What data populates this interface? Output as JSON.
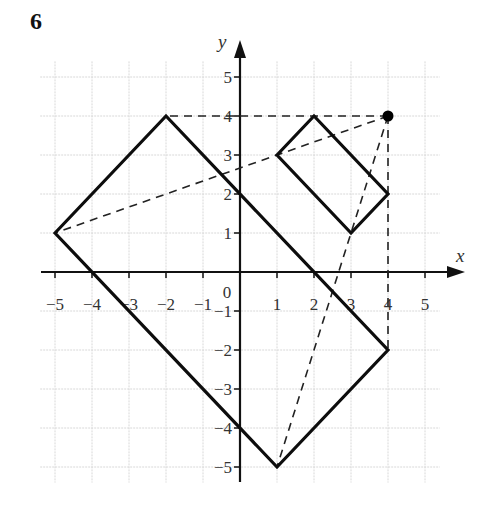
{
  "question_number": "6",
  "chart_data": {
    "type": "scatter",
    "title": "",
    "xlabel": "x",
    "ylabel": "y",
    "xlim": [
      -5.4,
      5.4
    ],
    "ylim": [
      -5.4,
      5.4
    ],
    "grid": true,
    "origin_label": "0",
    "x_ticks": [
      -5,
      -4,
      -3,
      -2,
      -1,
      1,
      2,
      3,
      4,
      5
    ],
    "y_ticks": [
      -5,
      -4,
      -3,
      -2,
      -1,
      1,
      2,
      3,
      4,
      5
    ],
    "x_tick_labels": [
      "−5",
      "−4",
      "−3",
      "−2",
      "−1",
      "1",
      "2",
      "3",
      "4",
      "5"
    ],
    "y_tick_labels": [
      "−5",
      "−4",
      "−3",
      "−2",
      "−1",
      "1",
      "2",
      "3",
      "4",
      "5"
    ],
    "shapes": [
      {
        "name": "large-rectangle",
        "style": "solid",
        "vertices": [
          [
            -5,
            1
          ],
          [
            -2,
            4
          ],
          [
            4,
            -2
          ],
          [
            1,
            -5
          ]
        ]
      },
      {
        "name": "small-rectangle",
        "style": "solid",
        "vertices": [
          [
            1,
            3
          ],
          [
            2,
            4
          ],
          [
            4,
            2
          ],
          [
            3,
            1
          ]
        ]
      }
    ],
    "center_point": [
      4,
      4
    ],
    "dashed_lines": [
      {
        "from": [
          4,
          4
        ],
        "to": [
          -2,
          4
        ]
      },
      {
        "from": [
          4,
          4
        ],
        "to": [
          -5,
          1
        ]
      },
      {
        "from": [
          4,
          4
        ],
        "to": [
          1,
          -5
        ]
      },
      {
        "from": [
          4,
          4
        ],
        "to": [
          4,
          -2
        ]
      }
    ]
  }
}
